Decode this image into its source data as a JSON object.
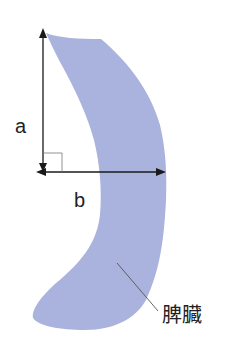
{
  "diagram": {
    "labels": {
      "a": "a",
      "b": "b",
      "organ": "脾臓"
    },
    "colors": {
      "organ_fill": "#a9b3dd",
      "line": "#1a1a1a",
      "leader": "#555555",
      "background": "#ffffff"
    },
    "measurements": [
      {
        "name": "a",
        "orientation": "vertical",
        "description": "height of organ"
      },
      {
        "name": "b",
        "orientation": "horizontal",
        "description": "width to outer edge"
      }
    ],
    "right_angle_marker": true
  }
}
